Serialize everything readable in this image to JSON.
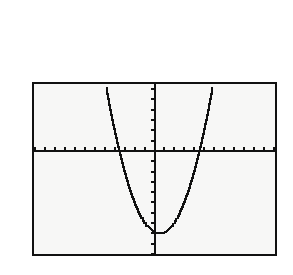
{
  "device": {
    "type": "graphing-calculator-screen",
    "screen": {
      "x": 32,
      "y": 82,
      "width": 245,
      "height": 174
    },
    "background_color": "#f7f7f6",
    "border_color": "#111111",
    "border_width_px": 2,
    "page_background_color": "#ffffff",
    "trace_color": "#111111"
  },
  "chart_data": {
    "type": "line",
    "title": "",
    "subtitle": "",
    "xlabel": "",
    "ylabel": "",
    "grid": false,
    "legend": null,
    "legend_position": "none",
    "annotations": [],
    "axis_style": "calculator-tickmarks",
    "xlim": [
      -12.1,
      12.1
    ],
    "ylim": [
      -10.0,
      6.5
    ],
    "xtick_interval": 1,
    "ytick_interval": 1,
    "xtick_labels": [],
    "ytick_labels": [],
    "x_axis_y_value": 0,
    "y_axis_x_value": 0,
    "features": {
      "vertex": [
        0.45,
        -8.0
      ],
      "x_intercepts": [
        -3.55,
        4.45
      ],
      "y_intercept": -7.9,
      "opens": "up",
      "leading_coefficient": 0.5
    },
    "series": [
      {
        "name": "y1",
        "equation": "y = 0.5(x - 0.45)^2 - 8",
        "color": "#111111",
        "x": [
          -5.7,
          -5.4,
          -5.1,
          -4.8,
          -4.5,
          -4.2,
          -3.9,
          -3.6,
          -3.3,
          -3.0,
          -2.7,
          -2.4,
          -2.1,
          -1.8,
          -1.5,
          -1.2,
          -0.9,
          -0.6,
          -0.3,
          0.0,
          0.3,
          0.45,
          0.6,
          0.9,
          1.2,
          1.5,
          1.8,
          2.1,
          2.4,
          2.7,
          3.0,
          3.3,
          3.6,
          3.9,
          4.2,
          4.5,
          4.8,
          5.1,
          5.4,
          5.7,
          6.0,
          6.3,
          6.6
        ],
        "y": [
          10.92,
          9.14,
          7.48,
          5.94,
          4.52,
          3.22,
          4.0,
          0.98,
          0.05,
          -0.05,
          -1.96,
          -2.56,
          -5.0,
          -5.47,
          -6.0,
          -6.44,
          -6.82,
          -7.2,
          -7.52,
          -7.9,
          -7.99,
          -8.0,
          -7.99,
          -7.9,
          -7.72,
          -7.44,
          -7.08,
          -6.64,
          -6.1,
          -5.5,
          -4.75,
          -4.0,
          -3.04,
          -2.06,
          -1.0,
          0.08,
          1.3,
          2.6,
          4.0,
          5.5,
          7.06,
          8.74,
          10.5
        ]
      }
    ]
  }
}
